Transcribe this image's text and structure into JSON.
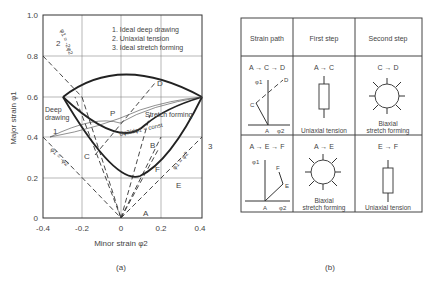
{
  "figure_a": {
    "caption": "(a)",
    "ylabel": "Major strain φ1",
    "xlabel": "Minor strain φ2",
    "y_ticks": [
      "0",
      "0.2",
      "0.4",
      "0.6",
      "0.8",
      "1.0"
    ],
    "x_ticks": [
      "-0.4",
      "-0.2",
      "0",
      "0.2",
      "0.4"
    ],
    "legend": [
      "1. Ideal deep drawing",
      "2. Uniaxial tension",
      "3. Ideal stretch forming"
    ],
    "labels": {
      "deep_drawing": "Deep",
      "deep_drawing2": "drawing",
      "stretch_forming": "Stretch forming",
      "const": "dφ2/dφ1 ≈ const",
      "line2": "φ1 = -2φ2",
      "line1": "φ1 = -φ2",
      "line3": "φ1 = φ2",
      "num1": "1",
      "num2": "2",
      "num3": "3",
      "A": "A",
      "B": "B",
      "C": "C",
      "D": "D",
      "E": "E",
      "F": "F",
      "P": "P"
    }
  },
  "figure_b": {
    "caption": "(b)",
    "headers": [
      "Strain path",
      "First step",
      "Second step"
    ],
    "rows": [
      {
        "path": "A → C → D",
        "first_title": "A → C",
        "first_label": "Uniaxial tension",
        "second_title": "C → D",
        "second_label1": "Biaxial",
        "second_label2": "stretch forming",
        "ax1": "φ1",
        "ax2": "φ2",
        "p0": "A",
        "p1": "C",
        "p2": "D"
      },
      {
        "path": "A → E → F",
        "first_title": "A → E",
        "first_label1": "Biaxial",
        "first_label2": "stretch forming",
        "second_title": "E → F",
        "second_label": "Uniaxial tension",
        "ax1": "φ1",
        "ax2": "φ2",
        "p0": "A",
        "p1": "E",
        "p2": "F"
      }
    ]
  }
}
